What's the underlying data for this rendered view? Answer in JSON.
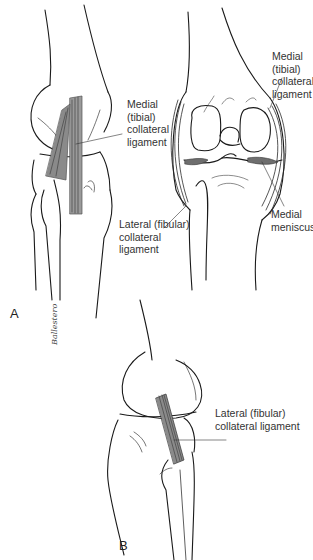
{
  "figure": {
    "panels": [
      {
        "id": "A",
        "label": "A",
        "views": [
          "medial view of knee",
          "anterior view of knee (flexed, opened)"
        ],
        "annotations": [
          {
            "id": "a_mcl_left",
            "lines": [
              "Medial",
              "(tibial)",
              "collateral",
              "ligament"
            ]
          },
          {
            "id": "a_mcl_right",
            "lines": [
              "Medial",
              "(tibial)",
              "collateral",
              "ligament"
            ]
          },
          {
            "id": "a_lcl",
            "lines": [
              "Lateral (fibular)",
              "collateral",
              "ligament"
            ]
          },
          {
            "id": "a_meniscus",
            "lines": [
              "Medial",
              "meniscus"
            ]
          }
        ],
        "signature": "Ballestero"
      },
      {
        "id": "B",
        "label": "B",
        "views": [
          "lateral view of knee"
        ],
        "annotations": [
          {
            "id": "b_lcl",
            "lines": [
              "Lateral (fibular)",
              "collateral ligament"
            ]
          }
        ]
      }
    ],
    "colors": {
      "line": "#1a1a1a",
      "ligament_fill": "#8a8a8a",
      "meniscus_fill": "#6e6e6e",
      "text": "#333333",
      "background": "#ffffff"
    }
  }
}
